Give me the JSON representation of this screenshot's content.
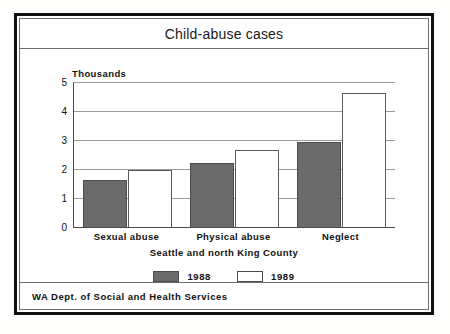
{
  "frame": {
    "title": "Child-abuse cases",
    "footer": "WA Dept. of Social and Health Services"
  },
  "chart_data": {
    "type": "bar",
    "title": "Child-abuse cases",
    "subtitle": "Seattle and north King County",
    "xlabel": "Seattle and north King County",
    "ylabel": "Thousands",
    "ylim": [
      0,
      5
    ],
    "yticks": [
      "0",
      "1",
      "2",
      "3",
      "4",
      "5"
    ],
    "grid": true,
    "legend_position": "bottom",
    "categories": [
      "Sexual abuse",
      "Physical abuse",
      "Neglect"
    ],
    "series": [
      {
        "name": "1988",
        "color": "#6b6b6b",
        "values": [
          1.65,
          2.25,
          2.95
        ]
      },
      {
        "name": "1989",
        "color": "#ffffff",
        "values": [
          2.0,
          2.7,
          4.65
        ]
      }
    ]
  }
}
